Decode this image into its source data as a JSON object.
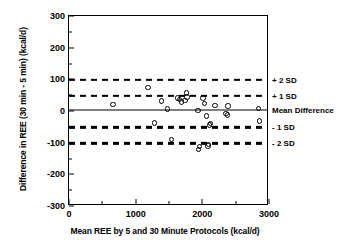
{
  "chart_data": {
    "type": "scatter",
    "title": "",
    "xlabel": "Mean REE by 5 and 30 Minute Protocols (kcal/d)",
    "ylabel": "Difference in REE (30 min - 5 min) (kcal/d)",
    "xlim": [
      0,
      3000
    ],
    "ylim": [
      -300,
      300
    ],
    "xticks": [
      0,
      1000,
      2000,
      3000
    ],
    "xtick_labels": [
      "0",
      "1000",
      "2000",
      "3000"
    ],
    "xminor_ticks": [
      500,
      1500,
      2500
    ],
    "yticks": [
      300,
      200,
      100,
      0,
      -100,
      -200,
      -300
    ],
    "ytick_labels": [
      "300",
      "200",
      "100",
      "0",
      "-100",
      "-200",
      "-300"
    ],
    "yminor_ticks": [
      250,
      150,
      50,
      -50,
      -150,
      -250
    ],
    "grid": false,
    "legend": "none",
    "reference_lines": [
      {
        "label": "+ 2 SD",
        "value": 98,
        "style": "dashed"
      },
      {
        "label": "+ 1 SD",
        "value": 48,
        "style": "dashed"
      },
      {
        "label": "Mean Difference",
        "value": 2,
        "style": "solid"
      },
      {
        "label": "- 1 SD",
        "value": -52,
        "style": "dashed"
      },
      {
        "label": "- 2 SD",
        "value": -102,
        "style": "dashed"
      }
    ],
    "series": [
      {
        "name": "Subjects",
        "marker": "open-circle",
        "color": "#000000",
        "points": [
          {
            "x": 660,
            "y": 20
          },
          {
            "x": 1185,
            "y": 75
          },
          {
            "x": 1280,
            "y": -38
          },
          {
            "x": 1385,
            "y": 31
          },
          {
            "x": 1480,
            "y": 6
          },
          {
            "x": 1535,
            "y": -90
          },
          {
            "x": 1625,
            "y": 41
          },
          {
            "x": 1660,
            "y": 37
          },
          {
            "x": 1690,
            "y": 29
          },
          {
            "x": 1740,
            "y": 33
          },
          {
            "x": 1765,
            "y": 57
          },
          {
            "x": 1770,
            "y": 44
          },
          {
            "x": 1935,
            "y": 2
          },
          {
            "x": 1945,
            "y": -122
          },
          {
            "x": 1960,
            "y": -112
          },
          {
            "x": 2010,
            "y": 41
          },
          {
            "x": 2030,
            "y": 24
          },
          {
            "x": 2060,
            "y": -16
          },
          {
            "x": 2085,
            "y": -110
          },
          {
            "x": 2095,
            "y": -105
          },
          {
            "x": 2110,
            "y": -44
          },
          {
            "x": 2125,
            "y": -40
          },
          {
            "x": 2190,
            "y": 17
          },
          {
            "x": 2355,
            "y": -8
          },
          {
            "x": 2375,
            "y": -12
          },
          {
            "x": 2385,
            "y": 16
          },
          {
            "x": 2845,
            "y": 8
          },
          {
            "x": 2855,
            "y": -32
          }
        ]
      }
    ]
  }
}
